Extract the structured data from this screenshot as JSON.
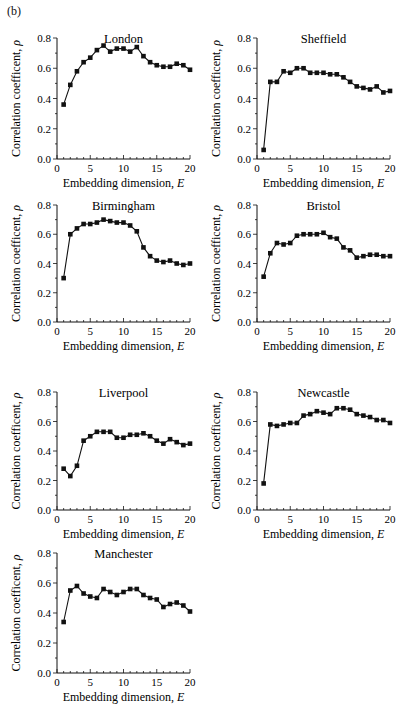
{
  "figure": {
    "panel_label": "(b)",
    "x_axis_label": "Embedding dimension, E",
    "y_axis_label": "Correlation coefficent, ρ"
  },
  "chart_data": [
    {
      "type": "line",
      "title": "London",
      "xlabel": "Embedding dimension, E",
      "ylabel": "Correlation coefficent, ρ",
      "xlim": [
        0,
        20
      ],
      "ylim": [
        0,
        0.8
      ],
      "xticks": [
        0,
        5,
        10,
        15,
        20
      ],
      "yticks": [
        "0.0",
        "0.2",
        "0.4",
        "0.6",
        "0.8"
      ],
      "grid": false,
      "x": [
        1,
        2,
        3,
        4,
        5,
        6,
        7,
        8,
        9,
        10,
        11,
        12,
        13,
        14,
        15,
        16,
        17,
        18,
        19,
        20
      ],
      "values": [
        0.36,
        0.49,
        0.58,
        0.64,
        0.67,
        0.72,
        0.75,
        0.71,
        0.73,
        0.73,
        0.71,
        0.74,
        0.68,
        0.64,
        0.62,
        0.61,
        0.61,
        0.63,
        0.62,
        0.59
      ]
    },
    {
      "type": "line",
      "title": "Sheffield",
      "xlabel": "Embedding dimension, E",
      "ylabel": "Correlation coefficent, ρ",
      "xlim": [
        0,
        20
      ],
      "ylim": [
        0,
        0.8
      ],
      "xticks": [
        0,
        5,
        10,
        15,
        20
      ],
      "yticks": [
        "0.0",
        "0.2",
        "0.4",
        "0.6",
        "0.8"
      ],
      "grid": false,
      "x": [
        1,
        2,
        3,
        4,
        5,
        6,
        7,
        8,
        9,
        10,
        11,
        12,
        13,
        14,
        15,
        16,
        17,
        18,
        19,
        20
      ],
      "values": [
        0.06,
        0.51,
        0.51,
        0.58,
        0.57,
        0.6,
        0.6,
        0.57,
        0.57,
        0.57,
        0.56,
        0.56,
        0.54,
        0.51,
        0.48,
        0.47,
        0.46,
        0.48,
        0.44,
        0.45
      ]
    },
    {
      "type": "line",
      "title": "Birmingham",
      "xlabel": "Embedding dimension, E",
      "ylabel": "Correlation coefficent, ρ",
      "xlim": [
        0,
        20
      ],
      "ylim": [
        0,
        0.8
      ],
      "xticks": [
        0,
        5,
        10,
        15,
        20
      ],
      "yticks": [
        "0.0",
        "0.2",
        "0.4",
        "0.6",
        "0.8"
      ],
      "grid": false,
      "x": [
        1,
        2,
        3,
        4,
        5,
        6,
        7,
        8,
        9,
        10,
        11,
        12,
        13,
        14,
        15,
        16,
        17,
        18,
        19,
        20
      ],
      "values": [
        0.3,
        0.6,
        0.64,
        0.67,
        0.67,
        0.68,
        0.7,
        0.69,
        0.68,
        0.68,
        0.66,
        0.62,
        0.51,
        0.45,
        0.42,
        0.41,
        0.42,
        0.4,
        0.39,
        0.4
      ]
    },
    {
      "type": "line",
      "title": "Bristol",
      "xlabel": "Embedding dimension, E",
      "ylabel": "Correlation coefficent, ρ",
      "xlim": [
        0,
        20
      ],
      "ylim": [
        0,
        0.8
      ],
      "xticks": [
        0,
        5,
        10,
        15,
        20
      ],
      "yticks": [
        "0.0",
        "0.2",
        "0.4",
        "0.6",
        "0.8"
      ],
      "grid": false,
      "x": [
        1,
        2,
        3,
        4,
        5,
        6,
        7,
        8,
        9,
        10,
        11,
        12,
        13,
        14,
        15,
        16,
        17,
        18,
        19,
        20
      ],
      "values": [
        0.31,
        0.47,
        0.54,
        0.53,
        0.54,
        0.59,
        0.6,
        0.6,
        0.6,
        0.61,
        0.58,
        0.57,
        0.51,
        0.49,
        0.44,
        0.45,
        0.46,
        0.46,
        0.45,
        0.45
      ]
    },
    {
      "type": "line",
      "title": "Liverpool",
      "xlabel": "Embedding dimension, E",
      "ylabel": "Correlation coefficent, ρ",
      "xlim": [
        0,
        20
      ],
      "ylim": [
        0,
        0.8
      ],
      "xticks": [
        0,
        5,
        10,
        15,
        20
      ],
      "yticks": [
        "0.0",
        "0.2",
        "0.4",
        "0.6",
        "0.8"
      ],
      "grid": false,
      "x": [
        1,
        2,
        3,
        4,
        5,
        6,
        7,
        8,
        9,
        10,
        11,
        12,
        13,
        14,
        15,
        16,
        17,
        18,
        19,
        20
      ],
      "values": [
        0.28,
        0.23,
        0.3,
        0.47,
        0.5,
        0.53,
        0.53,
        0.53,
        0.49,
        0.49,
        0.51,
        0.51,
        0.52,
        0.5,
        0.47,
        0.45,
        0.48,
        0.46,
        0.44,
        0.45
      ]
    },
    {
      "type": "line",
      "title": "Newcastle",
      "xlabel": "Embedding dimension, E",
      "ylabel": "Correlation coefficent, ρ",
      "xlim": [
        0,
        20
      ],
      "ylim": [
        0,
        0.8
      ],
      "xticks": [
        0,
        5,
        10,
        15,
        20
      ],
      "yticks": [
        "0.0",
        "0.2",
        "0.4",
        "0.6",
        "0.8"
      ],
      "grid": false,
      "x": [
        1,
        2,
        3,
        4,
        5,
        6,
        7,
        8,
        9,
        10,
        11,
        12,
        13,
        14,
        15,
        16,
        17,
        18,
        19,
        20
      ],
      "values": [
        0.18,
        0.58,
        0.57,
        0.58,
        0.59,
        0.59,
        0.64,
        0.65,
        0.67,
        0.66,
        0.65,
        0.69,
        0.69,
        0.68,
        0.65,
        0.64,
        0.63,
        0.61,
        0.61,
        0.59
      ]
    },
    {
      "type": "line",
      "title": "Manchester",
      "xlabel": "Embedding dimension, E",
      "ylabel": "Correlation coefficent, ρ",
      "xlim": [
        0,
        20
      ],
      "ylim": [
        0,
        0.8
      ],
      "xticks": [
        0,
        5,
        10,
        15,
        20
      ],
      "yticks": [
        "0.0",
        "0.2",
        "0.4",
        "0.6",
        "0.8"
      ],
      "grid": false,
      "x": [
        1,
        2,
        3,
        4,
        5,
        6,
        7,
        8,
        9,
        10,
        11,
        12,
        13,
        14,
        15,
        16,
        17,
        18,
        19,
        20
      ],
      "values": [
        0.34,
        0.55,
        0.58,
        0.53,
        0.51,
        0.5,
        0.56,
        0.54,
        0.52,
        0.54,
        0.56,
        0.56,
        0.52,
        0.5,
        0.49,
        0.44,
        0.46,
        0.47,
        0.45,
        0.41
      ]
    }
  ],
  "layout": {
    "panels": [
      {
        "left": 57,
        "top": 38,
        "width": 133,
        "height": 121
      },
      {
        "left": 257,
        "top": 38,
        "width": 133,
        "height": 121
      },
      {
        "left": 57,
        "top": 205,
        "width": 133,
        "height": 117
      },
      {
        "left": 257,
        "top": 205,
        "width": 133,
        "height": 117
      },
      {
        "left": 57,
        "top": 392,
        "width": 133,
        "height": 118
      },
      {
        "left": 257,
        "top": 392,
        "width": 133,
        "height": 118
      },
      {
        "left": 57,
        "top": 553,
        "width": 133,
        "height": 120
      }
    ]
  }
}
